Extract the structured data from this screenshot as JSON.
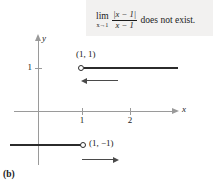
{
  "figure": {
    "caption": "(b)",
    "formula": {
      "limit_operator": "lim",
      "limit_subscript": "x→1",
      "numerator": "|x − 1|",
      "denominator": "x − 1",
      "conclusion": "does not exist."
    },
    "axes": {
      "x_label": "x",
      "y_label": "y",
      "x_ticks": [
        "1",
        "2"
      ],
      "y_ticks": [
        "1"
      ],
      "axis_color": "#9a9a9a"
    },
    "graph": {
      "curve_color": "#2b2b2b",
      "upper_branch": {
        "point_label": "(1, 1)",
        "endpoint_type": "open-circle",
        "direction_annotation": "left-arrow"
      },
      "lower_branch": {
        "point_label": "(1, −1)",
        "endpoint_type": "open-circle",
        "direction_annotation": "right-arrow"
      }
    }
  },
  "chart_data": {
    "type": "line",
    "title": "",
    "subtitle": "",
    "xlabel": "x",
    "ylabel": "y",
    "xlim": [
      -1,
      2.8
    ],
    "ylim": [
      -1.6,
      1.6
    ],
    "xticks": [
      1,
      2
    ],
    "yticks": [
      1
    ],
    "grid": false,
    "legend": null,
    "annotations": [
      {
        "text": "(1, 1)",
        "x": 1,
        "y": 1
      },
      {
        "text": "(1, −1)",
        "x": 1,
        "y": -1
      },
      {
        "text": "lim x→1 |x−1|/(x−1) does not exist.",
        "x": 1.6,
        "y": 1.5
      }
    ],
    "series": [
      {
        "name": "right branch (x > 1)",
        "values": [
          [
            1,
            1
          ],
          [
            3.0,
            1
          ]
        ],
        "open_endpoints": [
          [
            1,
            1
          ]
        ],
        "arrow_direction": "left"
      },
      {
        "name": "left branch (x < 1)",
        "values": [
          [
            -0.6,
            -1
          ],
          [
            1,
            -1
          ]
        ],
        "open_endpoints": [
          [
            1,
            -1
          ]
        ],
        "arrow_direction": "right"
      }
    ]
  }
}
